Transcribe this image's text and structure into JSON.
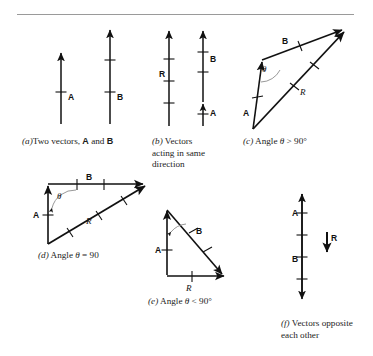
{
  "page": {
    "ghost_top_text": "",
    "figure_type": "vector-addition-diagram"
  },
  "vectors": {
    "a": "A",
    "b": "B",
    "r": "R",
    "theta": "θ"
  },
  "panels": [
    {
      "id": "a",
      "tag": "(a)",
      "caption_lines": [
        "Two vectors, A and B"
      ],
      "description": "two-parallel-up-arrows",
      "labels": [
        "A",
        "B"
      ]
    },
    {
      "id": "b",
      "tag": "(b)",
      "caption_lines": [
        "Vectors",
        "acting in same",
        "direction"
      ],
      "description": "resultant-same-direction",
      "labels": [
        "R",
        "A",
        "B"
      ]
    },
    {
      "id": "c",
      "tag": "(c)",
      "caption_lines": [
        "Angle θ > 90°"
      ],
      "description": "obtuse-angle-triangle",
      "labels": [
        "A",
        "B",
        "R",
        "θ"
      ]
    },
    {
      "id": "d",
      "tag": "(d)",
      "caption_lines": [
        "Angle θ = 90"
      ],
      "description": "right-angle-triangle",
      "labels": [
        "A",
        "B",
        "R",
        "θ"
      ]
    },
    {
      "id": "e",
      "tag": "(e)",
      "caption_lines": [
        "Angle θ < 90°"
      ],
      "description": "acute-angle-triangle",
      "labels": [
        "A",
        "B",
        "R",
        "θ"
      ]
    },
    {
      "id": "f",
      "tag": "(f)",
      "caption_lines": [
        "Vectors opposite",
        "each other"
      ],
      "description": "opposing-vectors-with-small-resultant",
      "labels": [
        "A",
        "B",
        "R"
      ]
    }
  ],
  "captions": {
    "a_tag": "(a)",
    "a_text_1": "Two vectors, ",
    "a_text_a": "A",
    "a_text_2": " and ",
    "a_text_b": "B",
    "b_tag": "(b)",
    "b_line1": "Vectors",
    "b_line2": "acting in same",
    "b_line3": "direction",
    "c_tag": "(c)",
    "c_pre": "Angle ",
    "c_theta": "θ",
    "c_post": " > 90°",
    "d_tag": "(d)",
    "d_pre": "Angle ",
    "d_theta": "θ",
    "d_post": " = 90",
    "e_tag": "(e)",
    "e_pre": "Angle ",
    "e_theta": "θ",
    "e_post": " < 90°",
    "f_tag": "(f)",
    "f_line1": "Vectors opposite",
    "f_line2": "each other"
  },
  "colors": {
    "ink": "#111111",
    "rule": "#9a9a9a",
    "arc": "#8d8d8d",
    "background": "#ffffff"
  }
}
